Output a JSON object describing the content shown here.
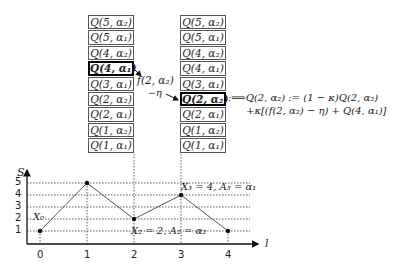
{
  "table_left": {
    "cells": [
      "Q(5, α₂)",
      "Q(5, α₁)",
      "Q(4, α₂)",
      "Q(4, α₁)",
      "Q(3, α₁)",
      "Q(2, α₂)",
      "Q(2, α₁)",
      "Q(1, α₂)",
      "Q(1, α₁)"
    ],
    "highlighted_index": 3
  },
  "table_right": {
    "cells": [
      "Q(5, α₂)",
      "Q(5, α₁)",
      "Q(4, α₂)",
      "Q(4, α₁)",
      "Q(3, α₁)",
      "Q(2, α₂)",
      "Q(2, α₁)",
      "Q(1, α₂)",
      "Q(1, α₁)"
    ],
    "highlighted_index": 5
  },
  "arrow_label": {
    "line1": "f(2, α₂)",
    "line2": "−η"
  },
  "update_rule": {
    "line1": ":⟹Q(2, α₂) := (1 − κ)Q(2, α₂)",
    "line2": "+κ[(f(2, α₂) − η) + Q(4, α₁)]"
  },
  "plot": {
    "y_axis_label": "S",
    "x_axis_label": "l",
    "x_ticks": [
      "0",
      "1",
      "2",
      "3",
      "4"
    ],
    "y_ticks": [
      "1",
      "2",
      "3",
      "4",
      "5"
    ],
    "points": [
      {
        "l": 0,
        "S": 1
      },
      {
        "l": 1,
        "S": 5
      },
      {
        "l": 2,
        "S": 2
      },
      {
        "l": 3,
        "S": 4
      },
      {
        "l": 4,
        "S": 1
      }
    ],
    "annotations": {
      "x0": "X₀",
      "x2": "X₂ = 2, A₂ = α₂",
      "x3": "X₃ = 4, A₃ = α₁"
    }
  }
}
